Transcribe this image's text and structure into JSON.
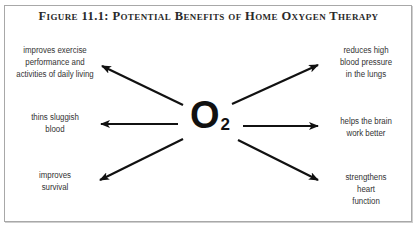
{
  "figure": {
    "title": "Figure 11.1: Potential Benefits of Home Oxygen Therapy",
    "center": {
      "symbol": "O",
      "subscript": "2"
    },
    "benefits_left": [
      {
        "lines": [
          "improves exercise",
          "performance and",
          "activities of daily living"
        ]
      },
      {
        "lines": [
          "thins sluggish",
          "blood"
        ]
      },
      {
        "lines": [
          "improves",
          "survival"
        ]
      }
    ],
    "benefits_right": [
      {
        "lines": [
          "reduces high",
          "blood pressure",
          "in the lungs"
        ]
      },
      {
        "lines": [
          "helps the brain",
          "work better"
        ]
      },
      {
        "lines": [
          "strengthens",
          "heart",
          "function"
        ]
      }
    ],
    "colors": {
      "arrow": "#111111",
      "text": "#333333",
      "border": "#a8a8a8"
    }
  }
}
